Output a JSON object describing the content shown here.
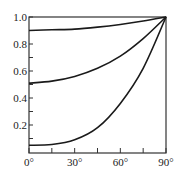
{
  "chart_data": {
    "type": "line",
    "title": "",
    "xlabel": "",
    "ylabel": "",
    "xlim": [
      0,
      90
    ],
    "ylim": [
      0,
      1.0
    ],
    "grid": false,
    "legend": null,
    "x_ticks": [
      0,
      30,
      60,
      90
    ],
    "x_tick_labels": [
      "0°",
      "30°",
      "60°",
      "90°"
    ],
    "x_minor_ticks": [
      15,
      45,
      75
    ],
    "y_ticks": [
      0.2,
      0.4,
      0.6,
      0.8,
      1.0
    ],
    "y_tick_labels": [
      "0.2",
      "0.4",
      "0.6",
      "0.8",
      "1.0"
    ],
    "y_minor_ticks": [
      0.1,
      0.3,
      0.5,
      0.7,
      0.9
    ],
    "x": [
      0,
      15,
      30,
      45,
      60,
      75,
      90
    ],
    "series": [
      {
        "name": "upper",
        "values": [
          0.9,
          0.905,
          0.91,
          0.925,
          0.945,
          0.97,
          1.0
        ]
      },
      {
        "name": "middle",
        "values": [
          0.51,
          0.525,
          0.56,
          0.62,
          0.71,
          0.84,
          1.0
        ]
      },
      {
        "name": "lower",
        "values": [
          0.05,
          0.055,
          0.09,
          0.18,
          0.36,
          0.62,
          1.0
        ]
      }
    ],
    "colors": {
      "line": "#1a1a1a",
      "axis": "#333333"
    }
  }
}
